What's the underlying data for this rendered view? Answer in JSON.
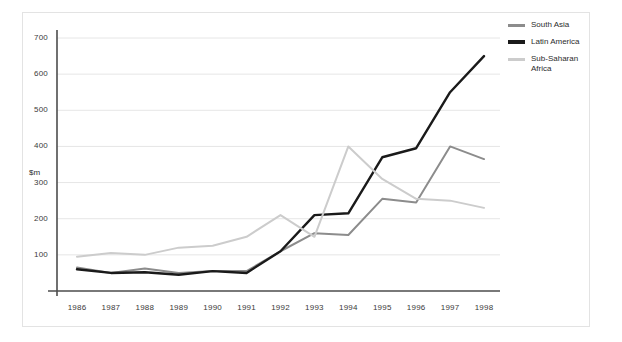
{
  "chart_data": {
    "type": "line",
    "title": "",
    "xlabel": "",
    "ylabel": "$m",
    "categories": [
      "1986",
      "1987",
      "1988",
      "1989",
      "1990",
      "1991",
      "1992",
      "1993",
      "1994",
      "1995",
      "1996",
      "1997",
      "1998"
    ],
    "ylim": [
      0,
      700
    ],
    "y_ticks": [
      100,
      200,
      300,
      400,
      500,
      600,
      700
    ],
    "grid": true,
    "legend_position": "right-top",
    "series": [
      {
        "name": "South Asia",
        "color": "#8c8c8c",
        "values": [
          65,
          50,
          62,
          50,
          55,
          55,
          110,
          160,
          155,
          255,
          245,
          400,
          365
        ]
      },
      {
        "name": "Latin America",
        "color": "#1a1a1a",
        "values": [
          60,
          50,
          52,
          45,
          55,
          50,
          110,
          210,
          215,
          370,
          395,
          550,
          650
        ]
      },
      {
        "name": "Sub-Saharan\nAfrica",
        "color": "#cccccc",
        "values": [
          95,
          105,
          100,
          120,
          125,
          150,
          210,
          150,
          400,
          310,
          255,
          250,
          230
        ]
      }
    ]
  },
  "axis": {
    "unit_label": "$m"
  },
  "legend": {
    "entries": [
      {
        "label": "South Asia",
        "color": "#8c8c8c"
      },
      {
        "label": "Latin America",
        "color": "#1a1a1a"
      },
      {
        "label": "Sub-Saharan\nAfrica",
        "color": "#cccccc"
      }
    ]
  }
}
